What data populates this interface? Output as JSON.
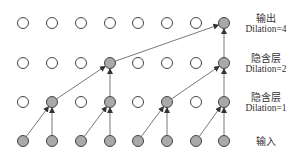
{
  "diagram": {
    "type": "dilated-causal-convolution",
    "columns": 8,
    "column_x": [
      23,
      52,
      81,
      110,
      138,
      167,
      196,
      224
    ],
    "node_radius": 5.5,
    "colors": {
      "active_fill": "#a9a9a9",
      "inactive_fill": "#ffffff",
      "stroke": "#444444",
      "arrow": "#555555"
    },
    "layers": [
      {
        "id": "output",
        "y": 23,
        "active": [
          7
        ],
        "label_cn": "输出",
        "label_en": "Dilation=4"
      },
      {
        "id": "hidden2",
        "y": 63,
        "active": [
          3,
          7
        ],
        "label_cn": "隐含层",
        "label_en": "Dilation=2"
      },
      {
        "id": "hidden1",
        "y": 102,
        "active": [
          1,
          3,
          5,
          7
        ],
        "label_cn": "隐含层",
        "label_en": "Dilation=1"
      },
      {
        "id": "input",
        "y": 141,
        "active": [
          0,
          1,
          2,
          3,
          4,
          5,
          6,
          7
        ],
        "label_cn": "输入",
        "label_en": ""
      }
    ],
    "edges": [
      {
        "from_layer": 3,
        "from": 0,
        "to_layer": 2,
        "to": 1
      },
      {
        "from_layer": 3,
        "from": 1,
        "to_layer": 2,
        "to": 1
      },
      {
        "from_layer": 3,
        "from": 2,
        "to_layer": 2,
        "to": 3
      },
      {
        "from_layer": 3,
        "from": 3,
        "to_layer": 2,
        "to": 3
      },
      {
        "from_layer": 3,
        "from": 4,
        "to_layer": 2,
        "to": 5
      },
      {
        "from_layer": 3,
        "from": 5,
        "to_layer": 2,
        "to": 5
      },
      {
        "from_layer": 3,
        "from": 6,
        "to_layer": 2,
        "to": 7
      },
      {
        "from_layer": 3,
        "from": 7,
        "to_layer": 2,
        "to": 7
      },
      {
        "from_layer": 2,
        "from": 1,
        "to_layer": 1,
        "to": 3
      },
      {
        "from_layer": 2,
        "from": 3,
        "to_layer": 1,
        "to": 3
      },
      {
        "from_layer": 2,
        "from": 5,
        "to_layer": 1,
        "to": 7
      },
      {
        "from_layer": 2,
        "from": 7,
        "to_layer": 1,
        "to": 7
      },
      {
        "from_layer": 1,
        "from": 3,
        "to_layer": 0,
        "to": 7
      },
      {
        "from_layer": 1,
        "from": 7,
        "to_layer": 0,
        "to": 7
      }
    ]
  },
  "labels": {
    "output": {
      "cn": "输出",
      "en": "Dilation=4"
    },
    "hidden2": {
      "cn": "隐含层",
      "en": "Dilation=2"
    },
    "hidden1": {
      "cn": "隐含层",
      "en": "Dilation=1"
    },
    "input": {
      "cn": "输入"
    }
  }
}
